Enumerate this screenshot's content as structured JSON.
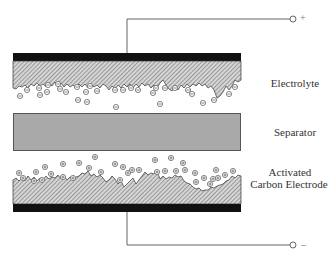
{
  "diagram": {
    "type": "electric double-layer capacitor cross-section",
    "colors": {
      "current_collector": "#111111",
      "electrode_hatch": "#9a9a9a",
      "separator_fill": "#a9a9a9",
      "separator_border": "#555555",
      "wire": "#555555",
      "ion": "#666666"
    },
    "labels": {
      "electrolyte": "Electrolyte",
      "separator": "Separator",
      "electrode_line1": "Activated",
      "electrode_line2": "Carbon Electrode"
    },
    "terminals": {
      "positive": "+",
      "negative": "–"
    },
    "ions": {
      "top_symbol": "negative-ion",
      "bottom_symbol": "positive-ion"
    }
  }
}
